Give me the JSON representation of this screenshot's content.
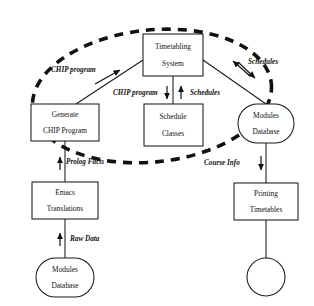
{
  "diagram": {
    "background_color": "#ffffff",
    "line_color": "#1a1a1a",
    "boundary": {
      "name": "system-boundary",
      "style": "dashed-ellipse",
      "stroke_color": "#111111",
      "label": ""
    },
    "nodes": [
      {
        "id": "timetabling-system",
        "shape": "rectangle",
        "line1": "Timetabling",
        "line2": "System"
      },
      {
        "id": "generate-chip-program",
        "shape": "rectangle",
        "line1": "Generate",
        "line2": "CHIP Program"
      },
      {
        "id": "schedule-classes",
        "shape": "rectangle",
        "line1": "Schedule",
        "line2": "Classes"
      },
      {
        "id": "modules-database-right",
        "shape": "stadium",
        "line1": "Modules",
        "line2": "Database"
      },
      {
        "id": "emacs-translations",
        "shape": "rectangle",
        "line1": "Emacs",
        "line2": "Translations"
      },
      {
        "id": "printing-timetables",
        "shape": "rectangle",
        "line1": "Printing",
        "line2": "Timetables"
      },
      {
        "id": "modules-database-bottom",
        "shape": "stadium",
        "line1": "Modules",
        "line2": "Database"
      },
      {
        "id": "output-circle",
        "shape": "circle",
        "line1": "",
        "line2": ""
      }
    ],
    "edge_labels": [
      {
        "id": "chip-program-diagonal",
        "text": "CHIP program"
      },
      {
        "id": "chip-program-down",
        "text": "CHIP program"
      },
      {
        "id": "schedules-up",
        "text": "Schedules"
      },
      {
        "id": "schedules-diagonal",
        "text": "Schedules"
      },
      {
        "id": "prolog-facts",
        "text": "Prolog Facts"
      },
      {
        "id": "course-info",
        "text": "Course Info"
      },
      {
        "id": "raw-data",
        "text": "Raw Data"
      }
    ]
  }
}
